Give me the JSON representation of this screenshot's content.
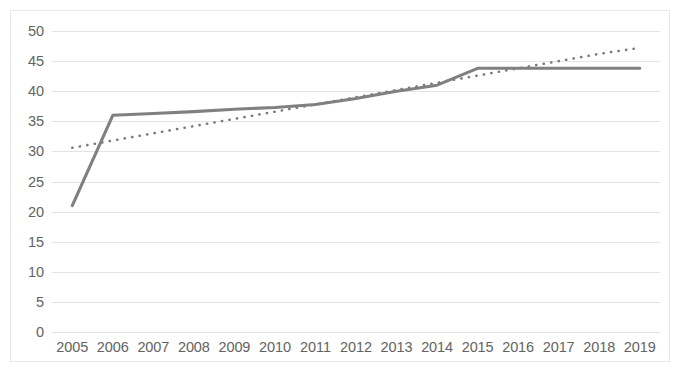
{
  "chart_data": {
    "type": "line",
    "title": "",
    "subtitle": "",
    "xlabel": "",
    "ylabel": "",
    "categories": [
      "2005",
      "2006",
      "2007",
      "2008",
      "2009",
      "2010",
      "2011",
      "2012",
      "2013",
      "2014",
      "2015",
      "2016",
      "2017",
      "2018",
      "2019"
    ],
    "series": [
      {
        "name": "data-series",
        "style": "solid",
        "color": "#808080",
        "values": [
          21,
          36,
          36.3,
          36.6,
          37,
          37.3,
          37.8,
          38.8,
          40,
          41,
          43.8,
          43.8,
          43.8,
          43.8,
          43.8
        ]
      },
      {
        "name": "trendline",
        "style": "dotted",
        "color": "#7a7a7a",
        "values": [
          30.6,
          31.8,
          33.0,
          34.2,
          35.4,
          36.6,
          37.8,
          39.0,
          40.2,
          41.4,
          42.6,
          43.8,
          45.0,
          46.2,
          47.2
        ]
      }
    ],
    "ylim": [
      0,
      50
    ],
    "ytick_step": 5,
    "yticks": [
      "0",
      "5",
      "10",
      "15",
      "20",
      "25",
      "30",
      "35",
      "40",
      "45",
      "50"
    ],
    "grid": {
      "horizontal": true,
      "vertical": false,
      "color": "#e4e4e4"
    },
    "legend": {
      "visible": false,
      "position": "none"
    },
    "axis_label_color": "#636363",
    "border_color": "#e9e9e9",
    "background": "#ffffff"
  }
}
